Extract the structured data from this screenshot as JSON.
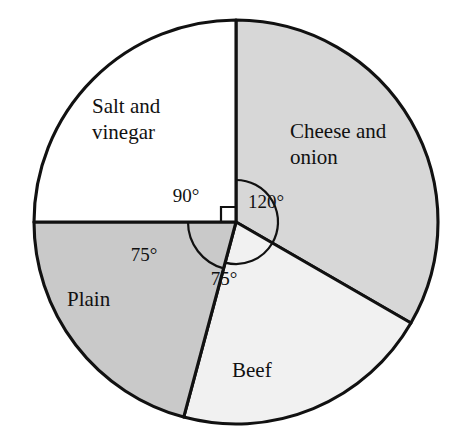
{
  "chart_data": {
    "type": "pie",
    "title": "",
    "subtitle": "",
    "xlabel": "",
    "ylabel": "",
    "legend_position": "none",
    "grid": false,
    "units": "degrees",
    "total_degrees": 360,
    "center": {
      "x": 236,
      "y": 222
    },
    "radius": 202,
    "start_angle_deg": 0,
    "direction": "clockwise",
    "categories": [
      "Cheese and onion",
      "Beef",
      "Plain",
      "Salt and vinegar"
    ],
    "values": [
      120,
      75,
      75,
      90
    ],
    "slices": [
      {
        "label": "Cheese and onion",
        "value": 120,
        "angle_text": "120°",
        "fill": "#d7d7d7",
        "start_deg": 0,
        "end_deg": 120,
        "label_line1": "Cheese and",
        "label_line2": "onion",
        "label_x": 290,
        "label_y": 133,
        "angle_label_x": 266,
        "angle_label_y": 204,
        "arc_radius": 42
      },
      {
        "label": "Beef",
        "value": 75,
        "angle_text": "75°",
        "fill": "#f1f1f1",
        "start_deg": 120,
        "end_deg": 195,
        "label_line1": "Beef",
        "label_line2": "",
        "label_x": 232,
        "label_y": 372,
        "angle_label_x": 224,
        "angle_label_y": 281,
        "arc_radius": 42
      },
      {
        "label": "Plain",
        "value": 75,
        "angle_text": "75°",
        "fill": "#c9c9c9",
        "start_deg": 195,
        "end_deg": 270,
        "label_line1": "Plain",
        "label_line2": "",
        "label_x": 67,
        "label_y": 301,
        "angle_label_x": 144,
        "angle_label_y": 257,
        "arc_radius": 48
      },
      {
        "label": "Salt and vinegar",
        "value": 90,
        "angle_text": "90°",
        "fill": "#ffffff",
        "start_deg": 270,
        "end_deg": 360,
        "label_line1": "Salt and",
        "label_line2": "vinegar",
        "label_x": 92,
        "label_y": 108,
        "angle_label_x": 186,
        "angle_label_y": 198,
        "arc_radius": 0
      }
    ],
    "annotations": [
      {
        "name": "right-angle-marker",
        "text": "",
        "at_slice": "Salt and vinegar"
      }
    ],
    "colors": {
      "outline": "#111111",
      "background": "#ffffff",
      "cheese_and_onion": "#d7d7d7",
      "beef": "#f1f1f1",
      "plain": "#c9c9c9",
      "salt_and_vinegar": "#ffffff"
    }
  }
}
